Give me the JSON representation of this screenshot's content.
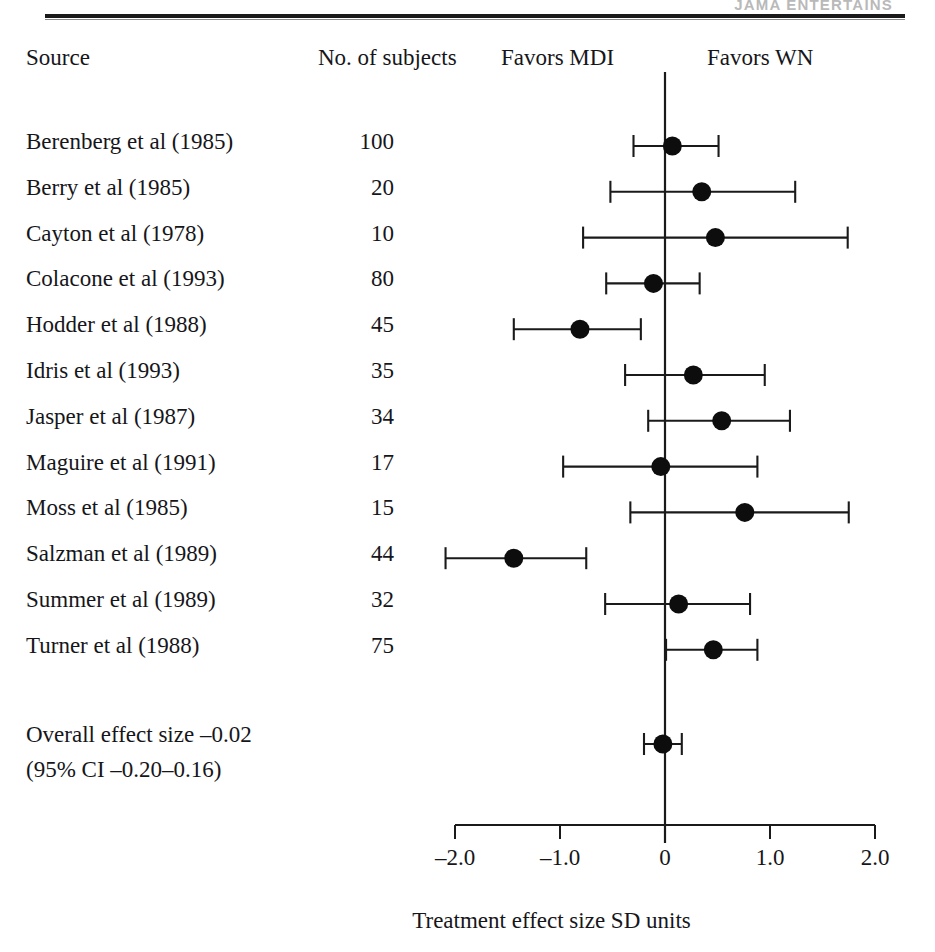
{
  "running_head": "JAMA ENTERTAINS",
  "header": {
    "source": "Source",
    "subjects": "No. of subjects",
    "favors_left": "Favors MDI",
    "favors_right": "Favors WN"
  },
  "summary": {
    "line1": "Overall effect size –0.02",
    "line2": "(95% CI –0.20–0.16)"
  },
  "chart_data": {
    "type": "scatter",
    "subtype": "forest-plot",
    "title": "",
    "xlabel": "Treatment effect size SD units",
    "ylabel": "",
    "xlim": [
      -2.3,
      2.3
    ],
    "xticks": [
      -2.0,
      -1.0,
      0,
      1.0,
      2.0
    ],
    "xticklabels": [
      "–2.0",
      "–1.0",
      "0",
      "1.0",
      "2.0"
    ],
    "grid": false,
    "reference_line": 0,
    "annotations": [
      "Favors MDI",
      "Favors WN"
    ],
    "columns": [
      "Source",
      "No. of subjects",
      "Effect size",
      "95% CI low",
      "95% CI high"
    ],
    "rows": [
      {
        "source": "Berenberg et al (1985)",
        "n": "100",
        "effect": 0.07,
        "ci_low": -0.3,
        "ci_high": 0.51
      },
      {
        "source": "Berry et al (1985)",
        "n": "20",
        "effect": 0.35,
        "ci_low": -0.52,
        "ci_high": 1.24
      },
      {
        "source": "Cayton et al (1978)",
        "n": "10",
        "effect": 0.48,
        "ci_low": -0.78,
        "ci_high": 1.74
      },
      {
        "source": "Colacone et al (1993)",
        "n": "80",
        "effect": -0.11,
        "ci_low": -0.56,
        "ci_high": 0.33
      },
      {
        "source": "Hodder et al (1988)",
        "n": "45",
        "effect": -0.81,
        "ci_low": -1.44,
        "ci_high": -0.23
      },
      {
        "source": "Idris et al (1993)",
        "n": "35",
        "effect": 0.27,
        "ci_low": -0.38,
        "ci_high": 0.95
      },
      {
        "source": "Jasper et al (1987)",
        "n": "34",
        "effect": 0.54,
        "ci_low": -0.16,
        "ci_high": 1.19
      },
      {
        "source": "Maguire et al (1991)",
        "n": "17",
        "effect": -0.04,
        "ci_low": -0.97,
        "ci_high": 0.88
      },
      {
        "source": "Moss et al (1985)",
        "n": "15",
        "effect": 0.76,
        "ci_low": -0.33,
        "ci_high": 1.75
      },
      {
        "source": "Salzman et al (1989)",
        "n": "44",
        "effect": -1.44,
        "ci_low": -2.09,
        "ci_high": -0.75
      },
      {
        "source": "Summer et al (1989)",
        "n": "32",
        "effect": 0.13,
        "ci_low": -0.57,
        "ci_high": 0.81
      },
      {
        "source": "Turner et al (1988)",
        "n": "75",
        "effect": 0.46,
        "ci_low": 0.01,
        "ci_high": 0.88
      }
    ],
    "overall": {
      "label": "Overall effect size",
      "effect": -0.02,
      "ci_low": -0.2,
      "ci_high": 0.16
    }
  }
}
